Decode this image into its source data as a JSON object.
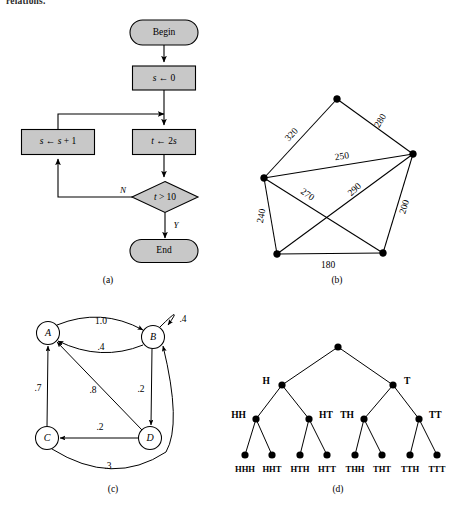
{
  "page": {
    "width": 469,
    "height": 510,
    "background": "#ffffff",
    "ink": "#000000",
    "shape_fill": "#c8c8c8",
    "top_text_fragment": "relations."
  },
  "panel_a": {
    "caption": "(a)",
    "caption_pos": {
      "x": 108,
      "y": 283
    },
    "type": "flowchart",
    "nodes": [
      {
        "id": "begin",
        "shape": "stadium",
        "label": "Begin",
        "x": 164,
        "y": 32,
        "w": 68,
        "h": 25
      },
      {
        "id": "init",
        "shape": "rect",
        "label": "s ← 0",
        "label_parts": [
          {
            "t": "s",
            "style": "italic"
          },
          {
            "t": " ← 0",
            "style": "normal"
          }
        ],
        "x": 164,
        "y": 78,
        "w": 63,
        "h": 24
      },
      {
        "id": "increment",
        "shape": "rect",
        "label": "s ← s + 1",
        "label_parts": [
          {
            "t": "s",
            "style": "italic"
          },
          {
            "t": " ← ",
            "style": "normal"
          },
          {
            "t": "s",
            "style": "italic"
          },
          {
            "t": " + 1",
            "style": "normal"
          }
        ],
        "x": 58,
        "y": 142,
        "w": 73,
        "h": 25
      },
      {
        "id": "double",
        "shape": "rect",
        "label": "t ← 2s",
        "label_parts": [
          {
            "t": "t",
            "style": "italic"
          },
          {
            "t": " ← 2",
            "style": "normal"
          },
          {
            "t": "s",
            "style": "italic"
          }
        ],
        "x": 164,
        "y": 142,
        "w": 63,
        "h": 25
      },
      {
        "id": "test",
        "shape": "diamond",
        "label": "t > 10",
        "label_parts": [
          {
            "t": "t",
            "style": "italic"
          },
          {
            "t": " > 10",
            "style": "normal"
          }
        ],
        "x": 165,
        "y": 197,
        "w": 65,
        "h": 31
      },
      {
        "id": "end",
        "shape": "stadium",
        "label": "End",
        "x": 164,
        "y": 251,
        "w": 68,
        "h": 23
      }
    ],
    "branch_labels": [
      {
        "text": "N",
        "x": 123,
        "y": 193
      },
      {
        "text": "Y",
        "x": 176,
        "y": 228
      }
    ]
  },
  "panel_b": {
    "caption": "(b)",
    "caption_pos": {
      "x": 337,
      "y": 283
    },
    "type": "weighted-graph",
    "nodes": [
      {
        "id": "top",
        "x": 337,
        "y": 99
      },
      {
        "id": "left",
        "x": 264,
        "y": 178
      },
      {
        "id": "right",
        "x": 413,
        "y": 154
      },
      {
        "id": "bottom_left",
        "x": 277,
        "y": 254
      },
      {
        "id": "bottom_right",
        "x": 383,
        "y": 253
      }
    ],
    "edges": [
      {
        "from": "left",
        "to": "top",
        "weight": "320",
        "label_x": 292,
        "label_y": 135,
        "rotate": -47
      },
      {
        "from": "top",
        "to": "right",
        "weight": "280",
        "label_x": 381,
        "label_y": 121,
        "rotate": -58
      },
      {
        "from": "left",
        "to": "right",
        "weight": "250",
        "label_x": 342,
        "label_y": 157,
        "rotate": -9
      },
      {
        "from": "left",
        "to": "bottom_right",
        "weight": "270",
        "label_x": 307,
        "label_y": 195,
        "rotate": 35
      },
      {
        "from": "bottom_left",
        "to": "right",
        "weight": "290",
        "label_x": 355,
        "label_y": 190,
        "rotate": -43
      },
      {
        "from": "left",
        "to": "bottom_left",
        "weight": "240",
        "label_x": 262,
        "label_y": 216,
        "rotate": -79
      },
      {
        "from": "right",
        "to": "bottom_right",
        "weight": "200",
        "label_x": 405,
        "label_y": 207,
        "rotate": -72
      },
      {
        "from": "bottom_left",
        "to": "bottom_right",
        "weight": "180",
        "label_x": 328,
        "label_y": 266,
        "rotate": 0
      }
    ]
  },
  "panel_c": {
    "caption": "(c)",
    "caption_pos": {
      "x": 113,
      "y": 492
    },
    "type": "state-diagram",
    "states": [
      {
        "id": "A",
        "label": "A",
        "x": 48,
        "y": 333,
        "r": 11.5
      },
      {
        "id": "B",
        "label": "B",
        "x": 153,
        "y": 337,
        "r": 11.5
      },
      {
        "id": "C",
        "label": "C",
        "x": 47,
        "y": 438,
        "r": 11.5
      },
      {
        "id": "D",
        "label": "D",
        "x": 150,
        "y": 438,
        "r": 11.5
      }
    ],
    "transitions": [
      {
        "from": "A",
        "to": "B",
        "prob": "1.0",
        "label_x": 101,
        "label_y": 322
      },
      {
        "from": "B",
        "to": "A",
        "prob": ".4",
        "label_x": 101,
        "label_y": 348
      },
      {
        "from": "B",
        "to": "B",
        "prob": ".4",
        "label_x": 183,
        "label_y": 320,
        "self_loop": true
      },
      {
        "from": "B",
        "to": "D",
        "prob": ".2",
        "label_x": 141,
        "label_y": 390
      },
      {
        "from": "C",
        "to": "A",
        "prob": ".7",
        "label_x": 38,
        "label_y": 389
      },
      {
        "from": "D",
        "to": "A",
        "prob": ".8",
        "label_x": 93,
        "label_y": 391
      },
      {
        "from": "D",
        "to": "C",
        "prob": ".2",
        "label_x": 100,
        "label_y": 428
      },
      {
        "from": "C",
        "to": "B",
        "prob": ".3",
        "label_x": 108,
        "label_y": 467
      }
    ]
  },
  "panel_d": {
    "caption": "(d)",
    "caption_pos": {
      "x": 338,
      "y": 492
    },
    "type": "binary-tree",
    "description": "coin-flip outcome tree of depth 3",
    "levels": [
      {
        "depth": 0,
        "nodes": [
          {
            "id": "root",
            "label": "",
            "x": 338,
            "y": 347
          }
        ]
      },
      {
        "depth": 1,
        "nodes": [
          {
            "id": "H",
            "label": "H",
            "x": 282,
            "y": 385,
            "label_x": 270,
            "label_y": 382,
            "label_anchor": "end"
          },
          {
            "id": "T",
            "label": "T",
            "x": 393,
            "y": 385,
            "label_x": 404,
            "label_y": 382,
            "label_anchor": "start"
          }
        ]
      },
      {
        "depth": 2,
        "nodes": [
          {
            "id": "HH",
            "label": "HH",
            "x": 256,
            "y": 419,
            "label_x": 246,
            "label_y": 416,
            "label_anchor": "end"
          },
          {
            "id": "HT",
            "label": "HT",
            "x": 309,
            "y": 419,
            "label_x": 319,
            "label_y": 416,
            "label_anchor": "start"
          },
          {
            "id": "TH",
            "label": "TH",
            "x": 364,
            "y": 419,
            "label_x": 354,
            "label_y": 416,
            "label_anchor": "end"
          },
          {
            "id": "TT",
            "label": "TT",
            "x": 419,
            "y": 419,
            "label_x": 429,
            "label_y": 416,
            "label_anchor": "start"
          }
        ]
      },
      {
        "depth": 3,
        "nodes": [
          {
            "id": "HHH",
            "label": "HHH",
            "x": 245,
            "y": 455,
            "label_x": 245,
            "label_y": 472
          },
          {
            "id": "HHT",
            "label": "HHT",
            "x": 272,
            "y": 455,
            "label_x": 272,
            "label_y": 472
          },
          {
            "id": "HTH",
            "label": "HTH",
            "x": 300,
            "y": 455,
            "label_x": 300,
            "label_y": 472
          },
          {
            "id": "HTT",
            "label": "HTT",
            "x": 327,
            "y": 455,
            "label_x": 327,
            "label_y": 472
          },
          {
            "id": "THH",
            "label": "THH",
            "x": 355,
            "y": 455,
            "label_x": 355,
            "label_y": 472
          },
          {
            "id": "THT",
            "label": "THT",
            "x": 382,
            "y": 455,
            "label_x": 382,
            "label_y": 472
          },
          {
            "id": "TTH",
            "label": "TTH",
            "x": 410,
            "y": 455,
            "label_x": 410,
            "label_y": 472
          },
          {
            "id": "TTT",
            "label": "TTT",
            "x": 437,
            "y": 455,
            "label_x": 437,
            "label_y": 472
          }
        ]
      }
    ],
    "edges": [
      {
        "from": "root",
        "to": "H"
      },
      {
        "from": "root",
        "to": "T"
      },
      {
        "from": "H",
        "to": "HH"
      },
      {
        "from": "H",
        "to": "HT"
      },
      {
        "from": "T",
        "to": "TH"
      },
      {
        "from": "T",
        "to": "TT"
      },
      {
        "from": "HH",
        "to": "HHH"
      },
      {
        "from": "HH",
        "to": "HHT"
      },
      {
        "from": "HT",
        "to": "HTH"
      },
      {
        "from": "HT",
        "to": "HTT"
      },
      {
        "from": "TH",
        "to": "THH"
      },
      {
        "from": "TH",
        "to": "THT"
      },
      {
        "from": "TT",
        "to": "TTH"
      },
      {
        "from": "TT",
        "to": "TTT"
      }
    ]
  }
}
